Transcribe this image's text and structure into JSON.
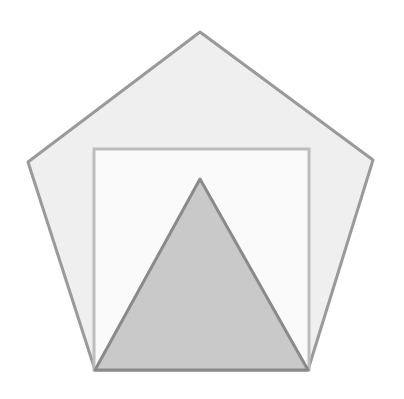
{
  "diagram": {
    "shapes": [
      {
        "id": "pentagon",
        "type": "polygon",
        "sides": 5,
        "points": [
          [
            200,
            32
          ],
          [
            373,
            160
          ],
          [
            308,
            370
          ],
          [
            95,
            370
          ],
          [
            28,
            162
          ]
        ],
        "fill": "#efefef",
        "stroke": "#9a9a9a",
        "stroke_width": 3
      },
      {
        "id": "square",
        "type": "polygon",
        "sides": 4,
        "points": [
          [
            94,
            149
          ],
          [
            309,
            149
          ],
          [
            309,
            370
          ],
          [
            94,
            370
          ]
        ],
        "fill": "#fafafa",
        "stroke": "#bdbdbd",
        "stroke_width": 3
      },
      {
        "id": "triangle",
        "type": "polygon",
        "sides": 3,
        "points": [
          [
            200,
            179
          ],
          [
            308,
            370
          ],
          [
            95,
            370
          ]
        ],
        "fill": "#c9c9c9",
        "stroke": "#8a8a8a",
        "stroke_width": 3
      }
    ]
  }
}
